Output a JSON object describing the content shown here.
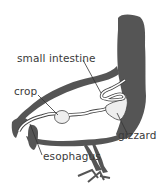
{
  "diagram": {
    "colors": {
      "body_fill": "#555555",
      "organ_fill": "#eeeeee",
      "background": "#ffffff",
      "line": "#333333"
    },
    "labels": {
      "small_intestine": "small intestine",
      "crop": "crop",
      "gizzard": "gizzard",
      "esophagus": "esophagus"
    }
  }
}
